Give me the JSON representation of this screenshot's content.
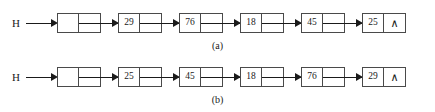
{
  "diagram": {
    "background_color": "#ffffff",
    "line_color": "#1a1a1a",
    "box_border_color": "#4a4a4a",
    "head_label": "H",
    "null_symbol": "∧",
    "rows": [
      {
        "id": "a",
        "caption": "(a)",
        "head_label": "H",
        "nodes": [
          {
            "value": "",
            "is_head_node": true,
            "next": "arrow"
          },
          {
            "value": "29",
            "is_head_node": false,
            "next": "arrow"
          },
          {
            "value": "76",
            "is_head_node": false,
            "next": "arrow"
          },
          {
            "value": "18",
            "is_head_node": false,
            "next": "arrow"
          },
          {
            "value": "45",
            "is_head_node": false,
            "next": "arrow"
          },
          {
            "value": "25",
            "is_head_node": false,
            "next": "∧"
          }
        ]
      },
      {
        "id": "b",
        "caption": "(b)",
        "head_label": "H",
        "nodes": [
          {
            "value": "",
            "is_head_node": true,
            "next": "arrow"
          },
          {
            "value": "25",
            "is_head_node": false,
            "next": "arrow"
          },
          {
            "value": "45",
            "is_head_node": false,
            "next": "arrow"
          },
          {
            "value": "18",
            "is_head_node": false,
            "next": "arrow"
          },
          {
            "value": "76",
            "is_head_node": false,
            "next": "arrow"
          },
          {
            "value": "29",
            "is_head_node": false,
            "next": "∧"
          }
        ]
      }
    ]
  }
}
